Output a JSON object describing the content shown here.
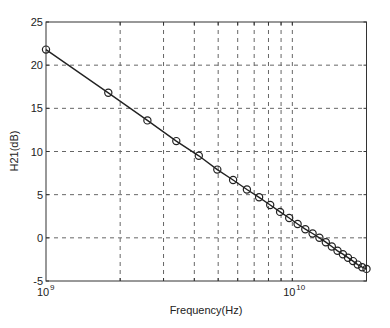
{
  "chart_data": {
    "type": "line",
    "title": "",
    "xlabel": "Frequency(Hz)",
    "ylabel": "H21(dB)",
    "xscale": "log",
    "xlim": [
      1000000000,
      20000000000
    ],
    "ylim": [
      -5,
      25
    ],
    "grid": true,
    "grid_style": "dashed",
    "legend": null,
    "x_tick_labels": [
      {
        "value": 1000000000,
        "base": "10",
        "exp": "9"
      },
      {
        "value": 10000000000,
        "base": "10",
        "exp": "10"
      }
    ],
    "y_ticks": [
      -5,
      0,
      5,
      10,
      15,
      20,
      25
    ],
    "x_minor_grid": [
      2000000000,
      3000000000,
      4000000000,
      5000000000,
      6000000000,
      7000000000,
      8000000000,
      9000000000,
      10000000000
    ],
    "series": [
      {
        "name": "H21",
        "marker": "circle",
        "line_color": "#222222",
        "x": [
          1000000000.0,
          1790000000.0,
          2580000000.0,
          3380000000.0,
          4170000000.0,
          4960000000.0,
          5750000000.0,
          6540000000.0,
          7330000000.0,
          8130000000.0,
          8920000000.0,
          9710000000.0,
          10500000000.0,
          11290000000.0,
          12080000000.0,
          12880000000.0,
          13670000000.0,
          14460000000.0,
          15250000000.0,
          16040000000.0,
          16830000000.0,
          17630000000.0,
          18420000000.0,
          19210000000.0,
          20000000000.0
        ],
        "values": [
          21.8,
          16.8,
          13.6,
          11.2,
          9.5,
          7.9,
          6.7,
          5.6,
          4.7,
          3.8,
          3.0,
          2.3,
          1.6,
          1.0,
          0.5,
          0.0,
          -0.5,
          -1.0,
          -1.5,
          -1.9,
          -2.3,
          -2.7,
          -3.1,
          -3.4,
          -3.6
        ]
      }
    ]
  },
  "colors": {
    "axis": "#333333",
    "grid": "#666666",
    "line": "#222222",
    "text": "#222222"
  }
}
